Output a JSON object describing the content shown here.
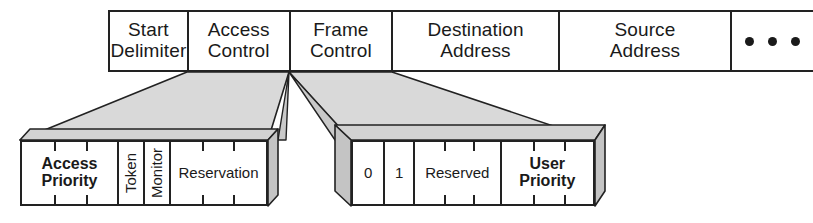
{
  "diagram": {
    "colors": {
      "line": "#222222",
      "funnel_fill": "#d9d9d9",
      "background": "#ffffff",
      "text": "#1a1a1a"
    },
    "frame_row": {
      "name": "token-ring-frame",
      "fields": [
        {
          "id": "start-delimiter",
          "line1": "Start",
          "line2": "Delimiter"
        },
        {
          "id": "access-control",
          "line1": "Access",
          "line2": "Control"
        },
        {
          "id": "frame-control",
          "line1": "Frame",
          "line2": "Control"
        },
        {
          "id": "destination-address",
          "line1": "Destination",
          "line2": "Address"
        },
        {
          "id": "source-address",
          "line1": "Source",
          "line2": "Address"
        },
        {
          "id": "continuation",
          "line1": "",
          "line2": "",
          "ellipsis": true,
          "dots": 3
        }
      ]
    },
    "access_control_detail": {
      "name": "access-control-subfields",
      "subfields": [
        {
          "id": "access-priority",
          "line1": "Access",
          "line2": "Priority",
          "bold": true,
          "vertical": false,
          "bits": 3
        },
        {
          "id": "token",
          "line1": "Token",
          "line2": "",
          "bold": false,
          "vertical": true,
          "bits": 1
        },
        {
          "id": "monitor",
          "line1": "Monitor",
          "line2": "",
          "bold": false,
          "vertical": true,
          "bits": 1
        },
        {
          "id": "reservation",
          "line1": "Reservation",
          "line2": "",
          "bold": false,
          "vertical": false,
          "bits": 3
        }
      ]
    },
    "frame_control_detail": {
      "name": "frame-control-subfields",
      "subfields": [
        {
          "id": "bit-zero",
          "line1": "0",
          "line2": "",
          "bold": false,
          "vertical": false,
          "bits": 1
        },
        {
          "id": "bit-one",
          "line1": "1",
          "line2": "",
          "bold": false,
          "vertical": false,
          "bits": 1
        },
        {
          "id": "reserved",
          "line1": "Reserved",
          "line2": "",
          "bold": false,
          "vertical": false,
          "bits": 3
        },
        {
          "id": "user-priority",
          "line1": "User",
          "line2": "Priority",
          "bold": true,
          "vertical": false,
          "bits": 3
        }
      ]
    }
  }
}
